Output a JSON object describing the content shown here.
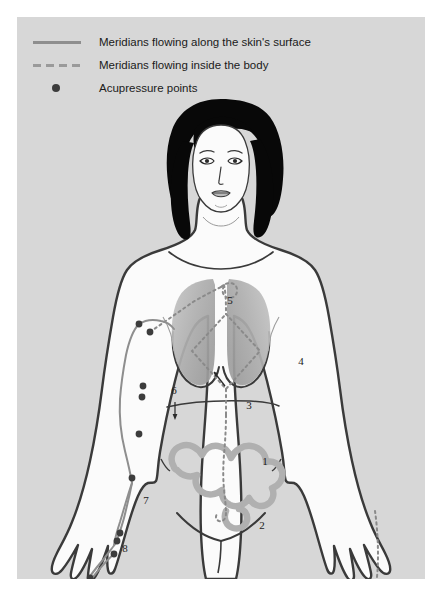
{
  "panel": {
    "background_color": "#d7d7d7",
    "page_background_color": "#ffffff"
  },
  "legend": {
    "items": [
      {
        "id": "solid-line",
        "marker": "solid-line-sample",
        "label": "Meridians flowing along the skin's surface",
        "color": "#8e8e8e"
      },
      {
        "id": "dashed-line",
        "marker": "dashed-line-sample",
        "label": "Meridians flowing inside the body",
        "color": "#9a9a9a"
      },
      {
        "id": "acupressure-points",
        "marker": "filled-dot-sample",
        "label": "Acupressure points",
        "color": "#3c3c3c"
      }
    ]
  },
  "figure": {
    "skin_color": "#fbfbfb",
    "outline_color": "#3a3a3a",
    "hair_color": "#080808",
    "organ_color": "#b4b4b4",
    "intestine_color": "#b0b0b0",
    "meridian_solid_color": "#8e8e8e",
    "meridian_dashed_color": "#8a8a8a",
    "point_color": "#3c3c3c"
  },
  "annotations": [
    {
      "id": "label-1",
      "text": "1",
      "x": 248,
      "y": 376,
      "target": "large-intestine"
    },
    {
      "id": "label-2",
      "text": "2",
      "x": 245,
      "y": 440,
      "target": "lower-intestine"
    },
    {
      "id": "label-3",
      "text": "3",
      "x": 232,
      "y": 320,
      "target": "sternum-point"
    },
    {
      "id": "label-4",
      "text": "4",
      "x": 284,
      "y": 276,
      "target": "lung"
    },
    {
      "id": "label-5",
      "text": "5",
      "x": 213,
      "y": 215,
      "target": "throat-meridian"
    },
    {
      "id": "label-6",
      "text": "6",
      "x": 157,
      "y": 305,
      "target": "upper-arm-meridian"
    },
    {
      "id": "label-7",
      "text": "7",
      "x": 129,
      "y": 415,
      "target": "forearm-meridian"
    },
    {
      "id": "label-8",
      "text": "8",
      "x": 108,
      "y": 463,
      "target": "wrist-points"
    },
    {
      "id": "label-9",
      "text": "9",
      "x": 406,
      "y": 524,
      "target": "right-hand-meridian"
    }
  ],
  "acupressure_points": [
    {
      "id": "point-shoulder-1",
      "x": 122,
      "y": 235
    },
    {
      "id": "point-shoulder-2",
      "x": 133,
      "y": 243
    },
    {
      "id": "point-upperarm-1",
      "x": 126,
      "y": 297
    },
    {
      "id": "point-upperarm-2",
      "x": 125,
      "y": 308
    },
    {
      "id": "point-upperarm-3",
      "x": 122,
      "y": 345
    },
    {
      "id": "point-elbow",
      "x": 115,
      "y": 389
    },
    {
      "id": "point-forearm",
      "x": 103,
      "y": 444
    },
    {
      "id": "point-wrist-1",
      "x": 100,
      "y": 452
    },
    {
      "id": "point-wrist-2",
      "x": 97,
      "y": 465
    },
    {
      "id": "point-thumb",
      "x": 73,
      "y": 489
    }
  ]
}
